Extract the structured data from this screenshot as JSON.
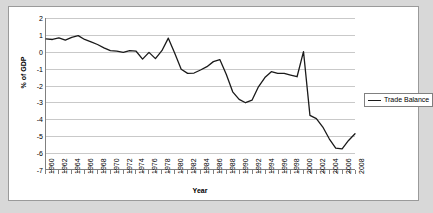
{
  "chart_data": {
    "type": "line",
    "title": "",
    "xlabel": "Year",
    "ylabel": "% of GDP",
    "ylim": [
      -7,
      2
    ],
    "xlim": [
      1960,
      2008
    ],
    "ytick_step": 1,
    "xtick_step": 2,
    "grid": true,
    "legend_position": "right",
    "yticks": [
      "2",
      "1",
      "0",
      "-1",
      "-2",
      "-3",
      "-4",
      "-5",
      "-6",
      "-7"
    ],
    "xticks": [
      "1960",
      "1962",
      "1964",
      "1966",
      "1968",
      "1970",
      "1972",
      "1974",
      "1976",
      "1978",
      "1980",
      "1982",
      "1984",
      "1986",
      "1988",
      "1990",
      "1992",
      "1994",
      "1996",
      "1998",
      "2000",
      "2002",
      "2004",
      "2006",
      "2008"
    ],
    "series": [
      {
        "name": "Trade Balance",
        "color": "#1a1a1a",
        "x": [
          1960,
          1961,
          1962,
          1963,
          1964,
          1965,
          1966,
          1967,
          1968,
          1969,
          1970,
          1971,
          1972,
          1973,
          1974,
          1975,
          1976,
          1977,
          1978,
          1979,
          1980,
          1981,
          1982,
          1983,
          1984,
          1985,
          1986,
          1987,
          1988,
          1989,
          1990,
          1991,
          1992,
          1993,
          1994,
          1995,
          1996,
          1997,
          1998,
          1999,
          2000,
          2001,
          2002,
          2003,
          2004,
          2005,
          2006,
          2007,
          2008
        ],
        "values": [
          0.75,
          0.72,
          0.82,
          0.68,
          0.85,
          0.95,
          0.72,
          0.58,
          0.42,
          0.22,
          0.05,
          0.02,
          -0.05,
          0.05,
          0.02,
          -0.45,
          -0.05,
          -0.42,
          0.05,
          0.8,
          -0.1,
          -1.05,
          -1.3,
          -1.28,
          -1.1,
          -0.9,
          -0.6,
          -0.48,
          -1.35,
          -2.4,
          -2.85,
          -3.05,
          -2.9,
          -2.1,
          -1.55,
          -1.2,
          -1.3,
          -1.3,
          -1.4,
          -1.5,
          0.0,
          -3.8,
          -4.0,
          -4.5,
          -5.2,
          -5.75,
          -5.8,
          -5.3,
          -4.9
        ]
      }
    ]
  },
  "legend": {
    "items": [
      {
        "label": "Trade Balance"
      }
    ]
  }
}
